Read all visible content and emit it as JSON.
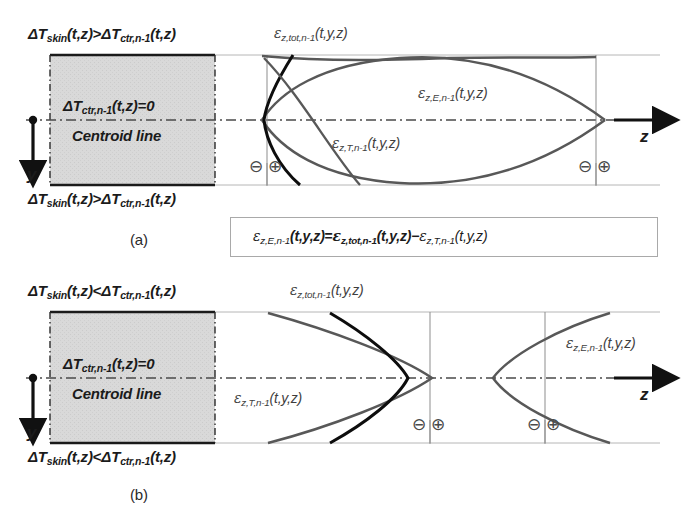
{
  "figure": {
    "type": "technical-diagram",
    "background": "#ffffff",
    "colors": {
      "gray_fill": "#d8d8d8",
      "dark_curve": "#101010",
      "gray_curve": "#565656",
      "thin_line": "#9a9a9a",
      "text": "#1b1b1b",
      "box_border": "#a9a9a9"
    }
  },
  "panels": [
    {
      "id": "a",
      "caption": "(a)",
      "top_condition": {
        "lead": "ΔT",
        "sub1": "skin",
        "args1": "(t,z)",
        "relation": ">",
        "lead2": "ΔT",
        "sub2": "ctr,n-1",
        "args2": "(t,z)"
      },
      "bottom_condition": {
        "lead": "ΔT",
        "sub1": "skin",
        "args1": "(t,z)",
        "relation": ">",
        "lead2": "ΔT",
        "sub2": "ctr,n-1",
        "args2": "(t,z)"
      },
      "box_text_line1": {
        "lead": "ΔT",
        "sub": "ctr,n-1",
        "args": "(t,z)=0"
      },
      "box_text_line2": "Centroid line",
      "axis_y_label": "y",
      "axis_z_label": "z",
      "curve_labels": [
        {
          "name": "eps-z-tot",
          "gk": "ε",
          "sub": "z,tot,n-1",
          "args": "(t,y,z)"
        },
        {
          "name": "eps-z-E",
          "gk": "ε",
          "sub": "z,E,n-1",
          "args": "(t,y,z)"
        },
        {
          "name": "eps-z-T",
          "gk": "ε",
          "sub": "z,T,n-1",
          "args": "(t,y,z)"
        }
      ],
      "sign_markers": [
        {
          "name": "minus-left",
          "glyph": "⊖"
        },
        {
          "name": "plus-left",
          "glyph": "⊕"
        },
        {
          "name": "minus-right",
          "glyph": "⊖"
        },
        {
          "name": "plus-right",
          "glyph": "⊕"
        }
      ]
    },
    {
      "id": "b",
      "caption": "(b)",
      "top_condition": {
        "lead": "ΔT",
        "sub1": "skin",
        "args1": "(t,z)",
        "relation": "<",
        "lead2": "ΔT",
        "sub2": "ctr,n-1",
        "args2": "(t,z)"
      },
      "bottom_condition": {
        "lead": "ΔT",
        "sub1": "skin",
        "args1": "(t,z)",
        "relation": "<",
        "lead2": "ΔT",
        "sub2": "ctr,n-1",
        "args2": "(t,z)"
      },
      "box_text_line1": {
        "lead": "ΔT",
        "sub": "ctr,n-1",
        "args": "(t,z)=0"
      },
      "box_text_line2": "Centroid line",
      "axis_y_label": "y",
      "axis_z_label": "z",
      "curve_labels": [
        {
          "name": "eps-z-tot",
          "gk": "ε",
          "sub": "z,tot,n-1",
          "args": "(t,y,z)"
        },
        {
          "name": "eps-z-E",
          "gk": "ε",
          "sub": "z,E,n-1",
          "args": "(t,y,z)"
        },
        {
          "name": "eps-z-T",
          "gk": "ε",
          "sub": "z,T,n-1",
          "args": "(t,y,z)"
        }
      ],
      "sign_markers": [
        {
          "name": "minus-left",
          "glyph": "⊖"
        },
        {
          "name": "plus-left",
          "glyph": "⊕"
        },
        {
          "name": "minus-right",
          "glyph": "⊖"
        },
        {
          "name": "plus-right",
          "glyph": "⊕"
        }
      ]
    }
  ],
  "equation_box": {
    "lhs": {
      "gk": "ε",
      "sub": "z,E,n-1",
      "args": "(t,y,z)"
    },
    "eq": "=",
    "term1": {
      "gk": "ε",
      "sub": "z,tot,n-1",
      "args": "(t,y,z)"
    },
    "minus": "−",
    "term2": {
      "gk": "ε",
      "sub": "z,T,n-1",
      "args": "(t,y,z)"
    }
  }
}
